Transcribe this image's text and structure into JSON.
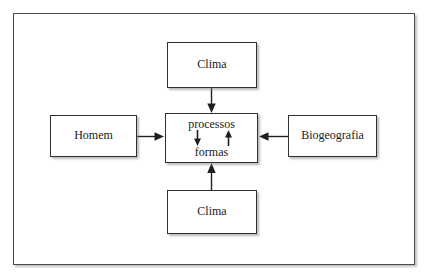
{
  "diagram": {
    "title": "",
    "background_color": "#ffffff",
    "frame": {
      "border_color": "#4a4a4a",
      "fill_color": "#ffffff"
    },
    "node_style": {
      "border_color": "#303030",
      "fill_color": "#ffffff",
      "text_color": "#1a1a1a",
      "shadow_color": "#8b8b8b"
    },
    "nodes": {
      "top": {
        "label": "Clima"
      },
      "left": {
        "label": "Homem"
      },
      "right": {
        "label": "Biogeografia"
      },
      "bottom": {
        "label": "Clima"
      },
      "center": {
        "label_top": "processos",
        "label_bottom": "formas",
        "inner_arrow_down": "arrow-down-icon",
        "inner_arrow_up": "arrow-up-icon"
      }
    },
    "connectors": [
      {
        "name": "clima-top-to-center",
        "from": "top",
        "to": "center",
        "direction": "down",
        "arrow_icon": "arrow-down-icon"
      },
      {
        "name": "homem-to-center",
        "from": "left",
        "to": "center",
        "direction": "right",
        "arrow_icon": "arrow-right-icon"
      },
      {
        "name": "biogeografia-to-center",
        "from": "right",
        "to": "center",
        "direction": "left",
        "arrow_icon": "arrow-left-icon"
      },
      {
        "name": "clima-bottom-to-center",
        "from": "bottom",
        "to": "center",
        "direction": "up",
        "arrow_icon": "arrow-up-icon"
      }
    ]
  }
}
